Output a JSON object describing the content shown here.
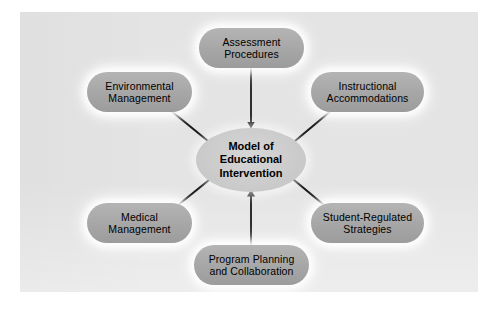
{
  "diagram": {
    "title": "Model of Educational Intervention",
    "type": "hub-and-spoke",
    "panel_color": "#e4e4e4",
    "page_color": "#ffffff",
    "center": {
      "label": "Model of\nEducational\nIntervention",
      "shape": "ellipse",
      "fill": "#cfcfcf",
      "text_color": "#000000"
    },
    "nodes": [
      {
        "id": "assessment-procedures",
        "label": "Assessment\nProcedures",
        "position": "top",
        "shape": "pill",
        "fill": "#a8a8a8"
      },
      {
        "id": "environmental-management",
        "label": "Environmental\nManagement",
        "position": "upper-left",
        "shape": "pill",
        "fill": "#a8a8a8"
      },
      {
        "id": "instructional-accommodations",
        "label": "Instructional\nAccommodations",
        "position": "upper-right",
        "shape": "pill",
        "fill": "#a8a8a8"
      },
      {
        "id": "medical-management",
        "label": "Medical\nManagement",
        "position": "lower-left",
        "shape": "pill",
        "fill": "#a8a8a8"
      },
      {
        "id": "student-regulated-strategies",
        "label": "Student-Regulated\nStrategies",
        "position": "lower-right",
        "shape": "pill",
        "fill": "#a8a8a8"
      },
      {
        "id": "program-planning-and-collaboration",
        "label": "Program Planning\nand Collaboration",
        "position": "bottom",
        "shape": "pill",
        "fill": "#a8a8a8"
      }
    ],
    "connectors": [
      {
        "from": "assessment-procedures",
        "to": "center",
        "style": "arrow",
        "direction": "down"
      },
      {
        "from": "environmental-management",
        "to": "center",
        "style": "line"
      },
      {
        "from": "instructional-accommodations",
        "to": "center",
        "style": "line"
      },
      {
        "from": "medical-management",
        "to": "center",
        "style": "line"
      },
      {
        "from": "student-regulated-strategies",
        "to": "center",
        "style": "line"
      },
      {
        "from": "program-planning-and-collaboration",
        "to": "center",
        "style": "arrow",
        "direction": "up"
      }
    ],
    "line_color": "#1a1a1a"
  }
}
